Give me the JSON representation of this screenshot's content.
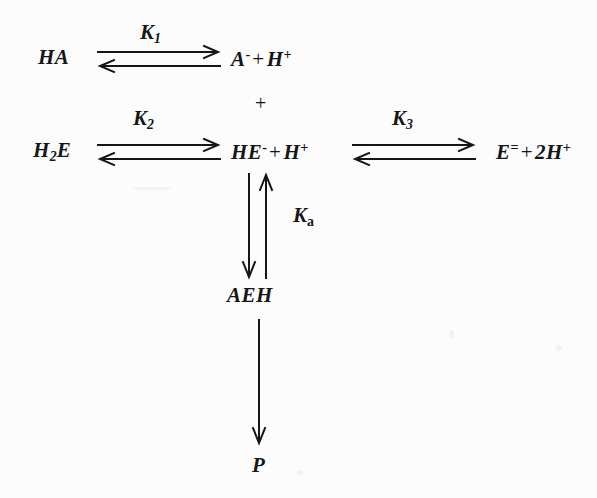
{
  "diagram": {
    "type": "reaction-scheme",
    "background_color": "#fcfcfc",
    "ink_color": "#161616"
  },
  "species": {
    "ha": {
      "base": "HA"
    },
    "a_minus": {
      "base": "A",
      "sup": "-"
    },
    "h_plus_1": {
      "base": "H",
      "sup": "+"
    },
    "h2e": {
      "base": "H",
      "sub": "2",
      "tail": "E"
    },
    "he_minus": {
      "base": "HE",
      "sup": "-"
    },
    "h_plus_2": {
      "base": "H",
      "sup": "+"
    },
    "e_dianion": {
      "base": "E",
      "sup": "="
    },
    "two_h_plus": {
      "base": "2H",
      "sup": "+"
    },
    "aeh": {
      "base": "AEH"
    },
    "p": {
      "base": "P"
    }
  },
  "operators": {
    "plus_row1": "+",
    "plus_row2_center": "+",
    "plus_row2_right": "+",
    "plus_vertical": "+"
  },
  "constants": {
    "k1": {
      "symbol": "K",
      "subscript": "1",
      "subscript_style": "italic"
    },
    "k2": {
      "symbol": "K",
      "subscript": "2",
      "subscript_style": "italic"
    },
    "k3": {
      "symbol": "K",
      "subscript": "3",
      "subscript_style": "italic"
    },
    "ka": {
      "symbol": "K",
      "subscript": "a",
      "subscript_style": "roman"
    }
  },
  "reactions": [
    {
      "id": "reaction-1",
      "reactants": "HA",
      "products": "A- + H+",
      "constant": "K1",
      "arrow": "double-horizontal"
    },
    {
      "id": "reaction-2",
      "reactants": "H2E",
      "products": "HE- + H+",
      "constant": "K2",
      "arrow": "double-horizontal"
    },
    {
      "id": "reaction-3",
      "reactants": "HE- + H+",
      "products": "E= + 2H+",
      "constant": "K3",
      "arrow": "double-horizontal"
    },
    {
      "id": "reaction-4",
      "reactants": "A- + HE-",
      "products": "AEH",
      "constant": "Ka",
      "arrow": "double-vertical"
    },
    {
      "id": "reaction-5",
      "reactants": "AEH",
      "products": "P",
      "constant": "",
      "arrow": "single-vertical-down"
    }
  ]
}
